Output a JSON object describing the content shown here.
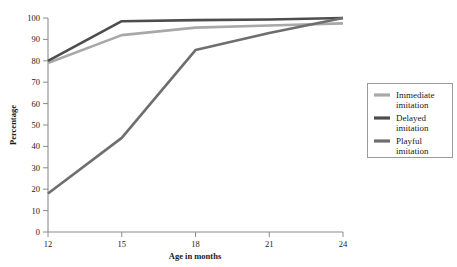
{
  "chart_data": {
    "type": "line",
    "title": "",
    "xlabel": "Age in months",
    "ylabel": "Percentage",
    "x": [
      12,
      15,
      18,
      21,
      24
    ],
    "xticks": [
      "12",
      "15",
      "18",
      "21",
      "24"
    ],
    "yticks": [
      "0",
      "10",
      "20",
      "30",
      "40",
      "50",
      "60",
      "70",
      "80",
      "90",
      "100"
    ],
    "xlim": [
      12,
      24
    ],
    "ylim": [
      0,
      100
    ],
    "grid": false,
    "legend_position": "right",
    "series": [
      {
        "name": "Immediate imitation",
        "label_line1": "Immediate",
        "label_line2": "imitation",
        "color": "#a8a8a8",
        "values": [
          79,
          92,
          95.5,
          96.5,
          97.5
        ]
      },
      {
        "name": "Delayed imitation",
        "label_line1": "Delayed",
        "label_line2": "imitation",
        "color": "#4d4d4d",
        "values": [
          80,
          98.5,
          99,
          99.3,
          100
        ]
      },
      {
        "name": "Playful imitation",
        "label_line1": "Playful",
        "label_line2": "imitation",
        "color": "#6e6e6e",
        "values": [
          18,
          44,
          85,
          93,
          100
        ]
      }
    ]
  }
}
